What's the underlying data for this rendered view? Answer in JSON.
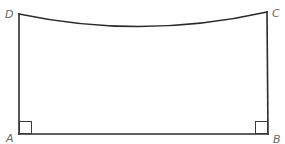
{
  "figure": {
    "type": "geometry-diagram",
    "shape": "quadrilateral with curved top edge",
    "vertices": {
      "A": {
        "label": "A",
        "x": 19,
        "y": 134
      },
      "B": {
        "label": "B",
        "x": 268,
        "y": 134
      },
      "C": {
        "label": "C",
        "x": 267,
        "y": 12
      },
      "D": {
        "label": "D",
        "x": 19,
        "y": 14
      }
    },
    "edges": [
      {
        "name": "AB",
        "kind": "straight"
      },
      {
        "name": "BC",
        "kind": "straight"
      },
      {
        "name": "CD",
        "kind": "curved",
        "sag_lowest_y": 27
      },
      {
        "name": "DA",
        "kind": "straight"
      }
    ],
    "right_angle_marks": [
      "A",
      "B"
    ],
    "colors": {
      "stroke": "#2b2b2b",
      "label": "#666666",
      "background": "#ffffff"
    }
  }
}
